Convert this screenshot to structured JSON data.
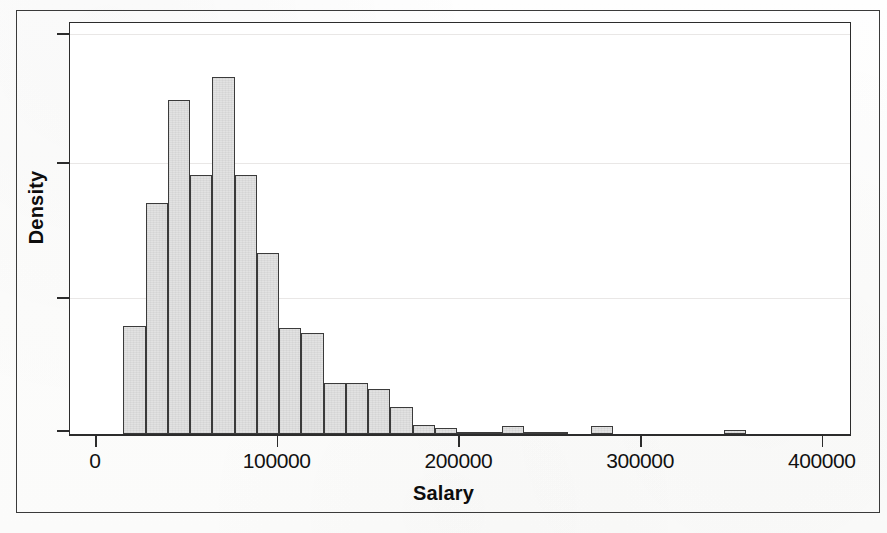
{
  "figure": {
    "background_color": "#fdfdfc",
    "frame_color": "#3a3a3a",
    "panel_color": "#ffffff"
  },
  "axis_titles": {
    "x": "Salary",
    "y": "Density"
  },
  "chart_data": {
    "type": "bar",
    "title": "",
    "subtitle": "",
    "xlabel": "Salary",
    "ylabel": "Density",
    "grid": true,
    "grid_orientation": "horizontal",
    "legend": null,
    "legend_position": "none",
    "bar_fill_color": "#e2e2e2",
    "bar_edge_color": "#3b3b3b",
    "xlim": [
      -10000,
      402000
    ],
    "ylim": [
      0,
      3.05e-05
    ],
    "xtick_labels": [
      "0",
      "100000",
      "200000",
      "300000",
      "400000"
    ],
    "xtick_values": [
      0,
      100000,
      200000,
      300000,
      400000
    ],
    "ytick_labels": [
      "",
      "",
      "",
      ""
    ],
    "ytick_values": [
      0,
      1e-05,
      2e-05,
      3e-05
    ],
    "bin_width": 12270,
    "bins": [
      {
        "x0": 15500,
        "x1": 27800,
        "density_rel": 0.272
      },
      {
        "x0": 27800,
        "x1": 40000,
        "density_rel": 0.58
      },
      {
        "x0": 40000,
        "x1": 52300,
        "density_rel": 0.84
      },
      {
        "x0": 52300,
        "x1": 64500,
        "density_rel": 0.652
      },
      {
        "x0": 64500,
        "x1": 76800,
        "density_rel": 0.898
      },
      {
        "x0": 76800,
        "x1": 89000,
        "density_rel": 0.652
      },
      {
        "x0": 89000,
        "x1": 101300,
        "density_rel": 0.456
      },
      {
        "x0": 101300,
        "x1": 113500,
        "density_rel": 0.266
      },
      {
        "x0": 113500,
        "x1": 125800,
        "density_rel": 0.253
      },
      {
        "x0": 125800,
        "x1": 138000,
        "density_rel": 0.127
      },
      {
        "x0": 138000,
        "x1": 150300,
        "density_rel": 0.127
      },
      {
        "x0": 150300,
        "x1": 162500,
        "density_rel": 0.112
      },
      {
        "x0": 162500,
        "x1": 174800,
        "density_rel": 0.068
      },
      {
        "x0": 174800,
        "x1": 187000,
        "density_rel": 0.023
      },
      {
        "x0": 187000,
        "x1": 199300,
        "density_rel": 0.016
      },
      {
        "x0": 199300,
        "x1": 211500,
        "density_rel": 0.004
      },
      {
        "x0": 211500,
        "x1": 223800,
        "density_rel": 0.004
      },
      {
        "x0": 223800,
        "x1": 236000,
        "density_rel": 0.021
      },
      {
        "x0": 236000,
        "x1": 248300,
        "density_rel": 0.004
      },
      {
        "x0": 248300,
        "x1": 260500,
        "density_rel": 0.004
      },
      {
        "x0": 272800,
        "x1": 285000,
        "density_rel": 0.02
      },
      {
        "x0": 346000,
        "x1": 358300,
        "density_rel": 0.011
      }
    ]
  },
  "axis_geometry": {
    "x_pixels_per_unit": 0.001817,
    "x_origin_px": 26,
    "baseline_y_px": 412,
    "panel_height_px": 413,
    "full_height_ratio": 0.966,
    "ytick_px": [
      11,
      140,
      275,
      408
    ]
  }
}
